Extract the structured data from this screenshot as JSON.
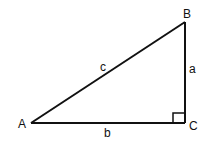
{
  "diagram": {
    "type": "right-triangle",
    "stroke_color": "#111111",
    "background": "#ffffff",
    "vertices": {
      "A": {
        "label": "A",
        "x": 31,
        "y": 123
      },
      "B": {
        "label": "B",
        "x": 185,
        "y": 22
      },
      "C": {
        "label": "C",
        "x": 185,
        "y": 123
      }
    },
    "sides": {
      "a": {
        "label": "a",
        "from": "B",
        "to": "C"
      },
      "b": {
        "label": "b",
        "from": "A",
        "to": "C"
      },
      "c": {
        "label": "c",
        "from": "A",
        "to": "B"
      }
    },
    "right_angle_at": "C"
  }
}
